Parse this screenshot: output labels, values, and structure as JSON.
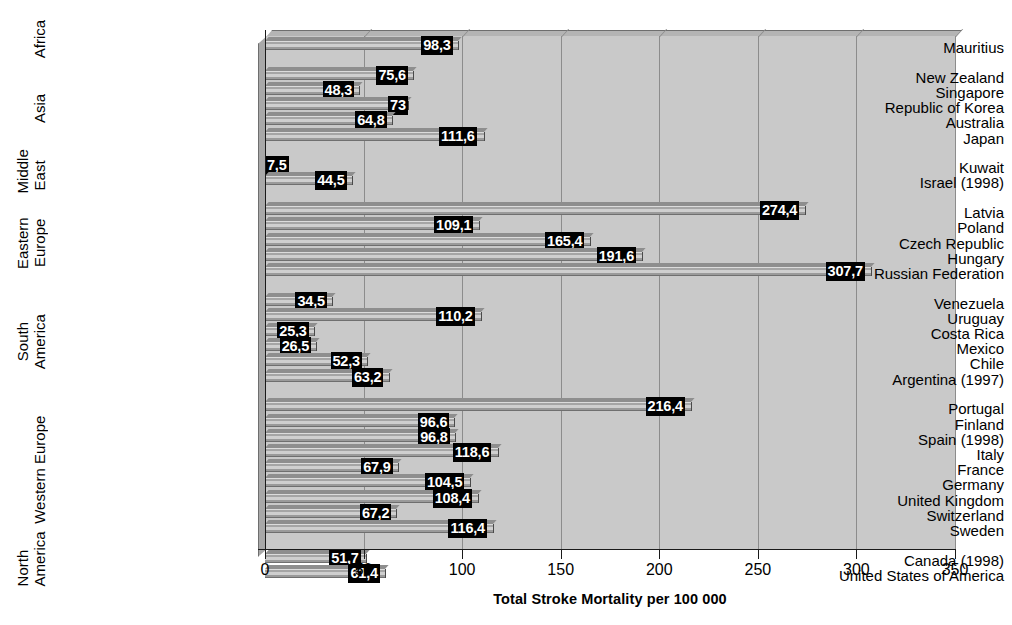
{
  "chart_data": {
    "type": "bar",
    "orientation": "horizontal",
    "title": "",
    "xlabel": "Total Stroke Mortality per 100 000",
    "ylabel": "",
    "xlim": [
      0,
      350
    ],
    "xticks": [
      "0",
      "50",
      "100",
      "150",
      "200",
      "250",
      "300",
      "350"
    ],
    "grid": true,
    "legend": "none",
    "decimal_separator": ",",
    "categories": [
      "Mauritius",
      "New Zealand",
      "Singapore",
      "Republic of Korea",
      "Australia",
      "Japan",
      "Kuwait",
      "Israel (1998)",
      "Latvia",
      "Poland",
      "Czech Republic",
      "Hungary",
      "Russian Federation",
      "Venezuela",
      "Uruguay",
      "Costa Rica",
      "Mexico",
      "Chile",
      "Argentina (1997)",
      "Portugal",
      "Finland",
      "Spain (1998)",
      "Italy",
      "France",
      "Germany",
      "United Kingdom",
      "Switzerland",
      "Sweden",
      "Canada (1998)",
      "United States of America"
    ],
    "values": [
      98.3,
      75.6,
      48.3,
      73,
      64.8,
      111.6,
      7.5,
      44.5,
      274.4,
      109.1,
      165.4,
      191.6,
      307.7,
      34.5,
      110.2,
      25.3,
      26.5,
      52.3,
      63.2,
      216.4,
      96.6,
      96.8,
      118.6,
      67.9,
      104.5,
      108.4,
      67.2,
      116.4,
      51.7,
      61.4
    ],
    "value_labels": [
      "98,3",
      "75,6",
      "48,3",
      "73",
      "64,8",
      "111,6",
      "7,5",
      "44,5",
      "274,4",
      "109,1",
      "165,4",
      "191,6",
      "307,7",
      "34,5",
      "110,2",
      "25,3",
      "26,5",
      "52,3",
      "63,2",
      "216,4",
      "96,6",
      "96,8",
      "118,6",
      "67,9",
      "104,5",
      "108,4",
      "67,2",
      "116,4",
      "51,7",
      "61,4"
    ],
    "groups": [
      {
        "name": "Africa",
        "lines": [
          "Africa"
        ],
        "count": 1
      },
      {
        "name": "Asia",
        "lines": [
          "Asia"
        ],
        "count": 5
      },
      {
        "name": "Middle East",
        "lines": [
          "Middle",
          "East"
        ],
        "count": 2
      },
      {
        "name": "Eastern Europe",
        "lines": [
          "Eastern",
          "Europe"
        ],
        "count": 5
      },
      {
        "name": "South America",
        "lines": [
          "South",
          "America"
        ],
        "count": 6
      },
      {
        "name": "Western Europe",
        "lines": [
          "Western Europe"
        ],
        "count": 9
      },
      {
        "name": "North America",
        "lines": [
          "North",
          "America"
        ],
        "count": 2
      }
    ],
    "colors": {
      "plot_background": "#c9c9c9",
      "bar_fill": "#b0b0b0",
      "value_label_background": "#000000",
      "value_label_text": "#ffffff",
      "gridline": "#8c8c8c",
      "axis": "#1a1a1a"
    }
  }
}
